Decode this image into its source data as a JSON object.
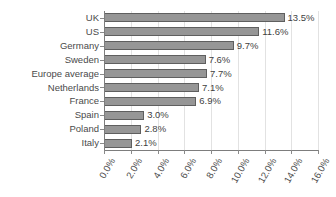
{
  "chart_data": {
    "type": "bar",
    "orientation": "horizontal",
    "title": "",
    "subtitle": "",
    "xlabel": "",
    "ylabel": "",
    "xlim": [
      0,
      16
    ],
    "grid": true,
    "legend": "none",
    "value_format": "percent",
    "categories": [
      "UK",
      "US",
      "Germany",
      "Sweden",
      "Europe average",
      "Netherlands",
      "France",
      "Spain",
      "Poland",
      "Italy"
    ],
    "values": [
      13.5,
      11.6,
      9.7,
      7.6,
      7.7,
      7.1,
      6.9,
      3.0,
      2.8,
      2.1
    ],
    "data_labels": [
      "13.5%",
      "11.6%",
      "9.7%",
      "7.6%",
      "7.7%",
      "7.1%",
      "6.9%",
      "3.0%",
      "2.8%",
      "2.1%"
    ],
    "xticks": [
      0,
      2,
      4,
      6,
      8,
      10,
      12,
      14,
      16
    ],
    "xtick_labels": [
      "0.0%",
      "2.0%",
      "4.0%",
      "6.0%",
      "8.0%",
      "10.0%",
      "12.0%",
      "14.0%",
      "16.0%"
    ],
    "colors": {
      "bar_fill": "#969696",
      "bar_border": "#5f5f5f",
      "gridline": "#e2e2e2",
      "axis": "#7d7d7d",
      "text": "#4a4a4a",
      "background": "#ffffff"
    }
  }
}
